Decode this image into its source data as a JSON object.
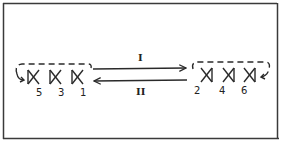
{
  "diagram": {
    "frame": {
      "stroke": "#3a3a3a"
    },
    "left_group": {
      "labels": [
        "5",
        "3",
        "1"
      ],
      "glyph_orientation": "bowtie-right-open"
    },
    "right_group": {
      "labels": [
        "2",
        "4",
        "6"
      ],
      "glyph_orientation": "bowtie-left-open"
    },
    "arrows": [
      {
        "label": "I",
        "direction": "left-to-right"
      },
      {
        "label": "II",
        "direction": "right-to-left"
      }
    ],
    "ink_color": "#2a2a2a"
  }
}
